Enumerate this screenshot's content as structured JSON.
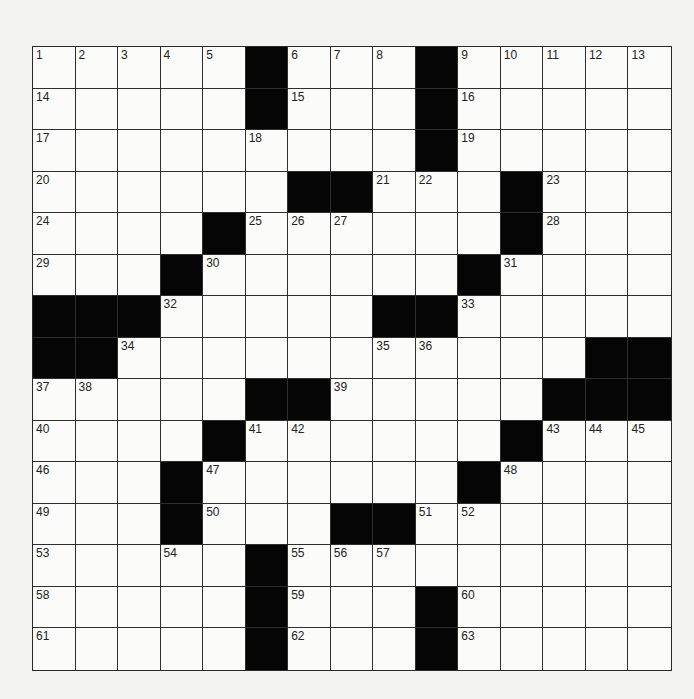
{
  "puzzle": {
    "rows": 15,
    "cols": 15,
    "block_color": "#050505",
    "cell_color": "#fbfbf9",
    "background_color": "#f3f3f1",
    "grid": [
      [
        "1",
        "2",
        "3",
        "4",
        "5",
        "#",
        "6",
        "7",
        "8",
        "#",
        "9",
        "10",
        "11",
        "12",
        "13"
      ],
      [
        "14",
        ".",
        ".",
        ".",
        ".",
        "#",
        "15",
        ".",
        ".",
        "#",
        "16",
        ".",
        ".",
        ".",
        "."
      ],
      [
        "17",
        ".",
        ".",
        ".",
        ".",
        "18",
        ".",
        ".",
        ".",
        "#",
        "19",
        ".",
        ".",
        ".",
        "."
      ],
      [
        "20",
        ".",
        ".",
        ".",
        ".",
        ".",
        "#",
        "#",
        "21",
        "22",
        ".",
        "#",
        "23",
        ".",
        "."
      ],
      [
        "24",
        ".",
        ".",
        ".",
        "#",
        "25",
        "26",
        "27",
        ".",
        ".",
        ".",
        "#",
        "28",
        ".",
        "."
      ],
      [
        "29",
        ".",
        ".",
        "#",
        "30",
        ".",
        ".",
        ".",
        ".",
        ".",
        "#",
        "31",
        ".",
        ".",
        "."
      ],
      [
        "#",
        "#",
        "#",
        "32",
        ".",
        ".",
        ".",
        ".",
        "#",
        "#",
        "33",
        ".",
        ".",
        ".",
        "."
      ],
      [
        "#",
        "#",
        "34",
        ".",
        ".",
        ".",
        ".",
        ".",
        "35",
        "36",
        ".",
        ".",
        ".",
        "#",
        "#"
      ],
      [
        "37",
        "38",
        ".",
        ".",
        ".",
        "#",
        "#",
        "39",
        ".",
        ".",
        ".",
        ".",
        "#",
        "#",
        "#"
      ],
      [
        "40",
        ".",
        ".",
        ".",
        "#",
        "41",
        "42",
        ".",
        ".",
        ".",
        ".",
        "#",
        "43",
        "44",
        "45"
      ],
      [
        "46",
        ".",
        ".",
        "#",
        "47",
        ".",
        ".",
        ".",
        ".",
        ".",
        "#",
        "48",
        ".",
        ".",
        "."
      ],
      [
        "49",
        ".",
        ".",
        "#",
        "50",
        ".",
        ".",
        "#",
        "#",
        "51",
        "52",
        ".",
        ".",
        ".",
        "."
      ],
      [
        "53",
        ".",
        ".",
        "54",
        ".",
        "#",
        "55",
        "56",
        "57",
        ".",
        ".",
        ".",
        ".",
        ".",
        "."
      ],
      [
        "58",
        ".",
        ".",
        ".",
        ".",
        "#",
        "59",
        ".",
        ".",
        "#",
        "60",
        ".",
        ".",
        ".",
        "."
      ],
      [
        "61",
        ".",
        ".",
        ".",
        ".",
        "#",
        "62",
        ".",
        ".",
        "#",
        "63",
        ".",
        ".",
        ".",
        "."
      ]
    ],
    "letters": []
  }
}
